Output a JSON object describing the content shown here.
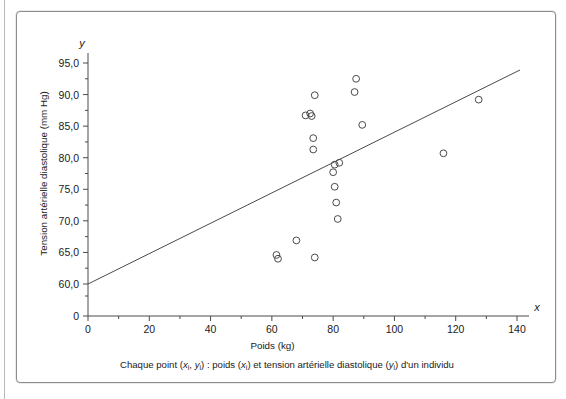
{
  "figure": {
    "caption": "Chaque point (xᵢ, yᵢ) : poids (xᵢ) et tension artérielle diastolique (yᵢ) d'un individu",
    "caption_parts": {
      "lead": "Chaque point (",
      "x_sym": "x",
      "x_sub": "i",
      "comma": ", ",
      "y_sym": "y",
      "y_sub": "i",
      "mid": ") : poids (",
      "x_sym2": "x",
      "x_sub2": "i",
      "mid2": ") et tension artérielle diastolique (",
      "y_sym2": "y",
      "y_sub2": "i",
      "tail": ") d'un individu"
    }
  },
  "colors": {
    "ink": "#1a1a1a",
    "axis": "#4a4a4a",
    "marker_stroke": "#4a4a4a",
    "border": "#8c8c8c",
    "background": "#ffffff"
  },
  "chart_data": {
    "type": "scatter",
    "title": "",
    "xlabel": "Poids (kg)",
    "ylabel": "Tension artérielle diastolique (mm Hg)",
    "x_axis_letter": "x",
    "y_axis_letter": "y",
    "xlim": [
      0,
      140
    ],
    "ylim": [
      60.0,
      95.0
    ],
    "y_origin_label": "0",
    "y_axis_broken": true,
    "grid": false,
    "legend": null,
    "xticks": [
      0,
      20,
      40,
      60,
      80,
      100,
      120,
      140
    ],
    "xtick_labels": [
      "0",
      "20",
      "40",
      "60",
      "80",
      "100",
      "120",
      "140"
    ],
    "x_minor_ticks": [
      10,
      30,
      50,
      70,
      90,
      110,
      130
    ],
    "yticks": [
      60.0,
      65.0,
      70.0,
      75.0,
      80.0,
      85.0,
      90.0,
      95.0
    ],
    "ytick_labels": [
      "60,0",
      "65,0",
      "70,0",
      "75,0",
      "80,0",
      "85,0",
      "90,0",
      "95,0"
    ],
    "y_minor_ticks": [
      62.5,
      67.5,
      72.5,
      77.5,
      82.5,
      87.5,
      92.5
    ],
    "points": [
      {
        "x": 61.5,
        "y": 64.6
      },
      {
        "x": 62.0,
        "y": 64.0
      },
      {
        "x": 68.0,
        "y": 66.9
      },
      {
        "x": 72.5,
        "y": 87.0
      },
      {
        "x": 73.0,
        "y": 86.6
      },
      {
        "x": 71.0,
        "y": 86.7
      },
      {
        "x": 74.0,
        "y": 89.9
      },
      {
        "x": 73.5,
        "y": 83.1
      },
      {
        "x": 73.5,
        "y": 81.3
      },
      {
        "x": 74.0,
        "y": 64.2
      },
      {
        "x": 80.5,
        "y": 78.9
      },
      {
        "x": 82.0,
        "y": 79.2
      },
      {
        "x": 80.0,
        "y": 77.7
      },
      {
        "x": 80.5,
        "y": 75.4
      },
      {
        "x": 81.0,
        "y": 72.9
      },
      {
        "x": 81.5,
        "y": 70.3
      },
      {
        "x": 87.5,
        "y": 92.5
      },
      {
        "x": 87.0,
        "y": 90.4
      },
      {
        "x": 89.5,
        "y": 85.2
      },
      {
        "x": 116.0,
        "y": 80.7
      },
      {
        "x": 127.5,
        "y": 89.2
      }
    ],
    "regression_line": {
      "x1": 0,
      "y1": 60.0,
      "x2": 141,
      "y2": 93.9,
      "description": "droite d'ajustement"
    }
  }
}
